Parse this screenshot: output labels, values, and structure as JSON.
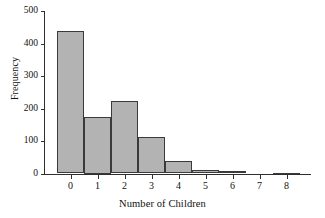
{
  "chart_data": {
    "type": "bar",
    "title": "",
    "subtitle": "",
    "xlabel": "Number of Children",
    "ylabel": "Frequency",
    "categories": [
      "0",
      "1",
      "2",
      "3",
      "4",
      "5",
      "6",
      "7",
      "8"
    ],
    "values": [
      438,
      175,
      222,
      111,
      38,
      11,
      8,
      0,
      3
    ],
    "ylim": [
      0,
      500
    ],
    "xlim": [
      -0.5,
      8.5
    ],
    "ytick_labels": [
      "0",
      "100",
      "200",
      "300",
      "400",
      "500"
    ],
    "ytick_values": [
      0,
      100,
      200,
      300,
      400,
      500
    ],
    "xtick_labels": [
      "0",
      "1",
      "2",
      "3",
      "4",
      "5",
      "6",
      "7",
      "8"
    ],
    "grid": false,
    "legend": null,
    "legend_position": "none",
    "bar_fill_color": "#b3b3b3",
    "bar_edge_color": "#3a3a3a",
    "axis_color": "#2e2e2e",
    "background_color": "#ffffff"
  }
}
